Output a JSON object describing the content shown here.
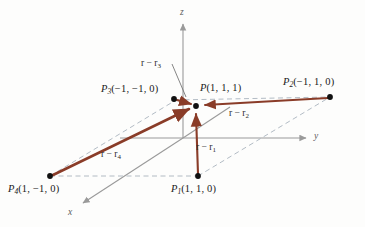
{
  "figure": {
    "type": "3d-vector-diagram",
    "caption_points": [
      {
        "id": "P",
        "label": "P",
        "subscript": "",
        "coords": "(1, 1, 1)",
        "x_px": 196,
        "y_px": 106
      },
      {
        "id": "P1",
        "label": "P",
        "subscript": "1",
        "coords": "(1, 1, 0)",
        "x_px": 198,
        "y_px": 176
      },
      {
        "id": "P2",
        "label": "P",
        "subscript": "2",
        "coords": "(-1, 1, 0)",
        "x_px": 330,
        "y_px": 97
      },
      {
        "id": "P3",
        "label": "P",
        "subscript": "3",
        "coords": "(-1, -1, 0)",
        "x_px": 174,
        "y_px": 99
      },
      {
        "id": "P4",
        "label": "P",
        "subscript": "4",
        "coords": "(1, -1, 0)",
        "x_px": 50,
        "y_px": 176
      }
    ],
    "vectors": [
      {
        "id": "r-r1",
        "label": "r − r",
        "subscript": "1",
        "from": "P1",
        "to": "P"
      },
      {
        "id": "r-r2",
        "label": "r − r",
        "subscript": "2",
        "from": "P2",
        "to": "P"
      },
      {
        "id": "r-r3",
        "label": "r − r",
        "subscript": "3",
        "from": "P3",
        "to": "P"
      },
      {
        "id": "r-r4",
        "label": "r − r",
        "subscript": "4",
        "from": "P4",
        "to": "P"
      }
    ],
    "axes": [
      {
        "id": "x",
        "label": "x"
      },
      {
        "id": "y",
        "label": "y"
      },
      {
        "id": "z",
        "label": "z"
      }
    ],
    "colors": {
      "vector": "#8a3c28",
      "axis": "#9a9a9a",
      "dashed": "#a9b3bd",
      "point": "#111111",
      "text": "#1a1a1a",
      "background": "#fdfdfc"
    }
  },
  "labels": {
    "P": {
      "name": "P",
      "sub": "",
      "coords": "(1, 1, 1)"
    },
    "P1": {
      "name": "P",
      "sub": "1",
      "coords": "(1, 1, 0)"
    },
    "P2": {
      "name": "P",
      "sub": "2",
      "coords": "(−1, 1, 0)"
    },
    "P3": {
      "name": "P",
      "sub": "3",
      "coords": "(−1, −1, 0)"
    },
    "P4": {
      "name": "P",
      "sub": "4",
      "coords": "(1, −1, 0)"
    },
    "v1": {
      "text": "r − r",
      "sub": "1"
    },
    "v2": {
      "text": "r − r",
      "sub": "2"
    },
    "v3": {
      "text": "r − r",
      "sub": "3"
    },
    "v4": {
      "text": "r − r",
      "sub": "4"
    },
    "ax": {
      "x": "x",
      "y": "y",
      "z": "z"
    }
  }
}
